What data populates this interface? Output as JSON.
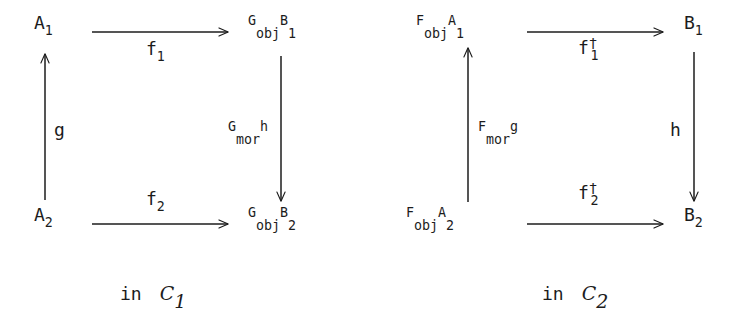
{
  "figure": {
    "type": "commutative-diagram-pair",
    "background_color": "#ffffff",
    "ink_color": "#1c1c1c",
    "diagrams": [
      {
        "id": "left",
        "caption_prefix": "in",
        "caption_category": "C",
        "caption_category_sub": "1",
        "nodes": {
          "top_left": {
            "base": "A",
            "sub": "1"
          },
          "top_right": {
            "functor": "G",
            "functor_sub": "obj",
            "base": "B",
            "sub": "1"
          },
          "bottom_left": {
            "base": "A",
            "sub": "2"
          },
          "bottom_right": {
            "functor": "G",
            "functor_sub": "obj",
            "base": "B",
            "sub": "2"
          }
        },
        "edges": {
          "top": {
            "base": "f",
            "sub": "1",
            "dagger": "",
            "direction": "right"
          },
          "bottom": {
            "base": "f",
            "sub": "2",
            "dagger": "",
            "direction": "right"
          },
          "left": {
            "base": "g",
            "sub": "",
            "functor": "",
            "functor_sub": "",
            "direction": "up"
          },
          "right": {
            "functor": "G",
            "functor_sub": "mor",
            "base": "h",
            "sub": "",
            "direction": "down"
          }
        }
      },
      {
        "id": "right",
        "caption_prefix": "in",
        "caption_category": "C",
        "caption_category_sub": "2",
        "nodes": {
          "top_left": {
            "functor": "F",
            "functor_sub": "obj",
            "base": "A",
            "sub": "1"
          },
          "top_right": {
            "base": "B",
            "sub": "1"
          },
          "bottom_left": {
            "functor": "F",
            "functor_sub": "obj",
            "base": "A",
            "sub": "2"
          },
          "bottom_right": {
            "base": "B",
            "sub": "2"
          }
        },
        "edges": {
          "top": {
            "base": "f",
            "sub": "1",
            "dagger": "†",
            "direction": "right"
          },
          "bottom": {
            "base": "f",
            "sub": "2",
            "dagger": "†",
            "direction": "right"
          },
          "left": {
            "functor": "F",
            "functor_sub": "mor",
            "base": "g",
            "sub": "",
            "direction": "up"
          },
          "right": {
            "base": "h",
            "sub": "",
            "functor": "",
            "functor_sub": "",
            "direction": "down"
          }
        }
      }
    ]
  },
  "left": {
    "node_A1_base": "A",
    "node_A1_sub": "1",
    "node_GobjB1_functor": "G",
    "node_GobjB1_functor_sub": "obj",
    "node_GobjB1_base": "B",
    "node_GobjB1_sub": "1",
    "node_A2_base": "A",
    "node_A2_sub": "2",
    "node_GobjB2_functor": "G",
    "node_GobjB2_functor_sub": "obj",
    "node_GobjB2_base": "B",
    "node_GobjB2_sub": "2",
    "edge_top_base": "f",
    "edge_top_sub": "1",
    "edge_bottom_base": "f",
    "edge_bottom_sub": "2",
    "edge_left_base": "g",
    "edge_right_functor": "G",
    "edge_right_functor_sub": "mor",
    "edge_right_base": "h",
    "caption_in": "in",
    "caption_cat": "C",
    "caption_cat_sub": "1"
  },
  "right": {
    "node_FobjA1_functor": "F",
    "node_FobjA1_functor_sub": "obj",
    "node_FobjA1_base": "A",
    "node_FobjA1_sub": "1",
    "node_B1_base": "B",
    "node_B1_sub": "1",
    "node_FobjA2_functor": "F",
    "node_FobjA2_functor_sub": "obj",
    "node_FobjA2_base": "A",
    "node_FobjA2_sub": "2",
    "node_B2_base": "B",
    "node_B2_sub": "2",
    "edge_top_base": "f",
    "edge_top_dagger": "†",
    "edge_top_sub": "1",
    "edge_bottom_base": "f",
    "edge_bottom_dagger": "†",
    "edge_bottom_sub": "2",
    "edge_left_functor": "F",
    "edge_left_functor_sub": "mor",
    "edge_left_base": "g",
    "edge_right_base": "h",
    "caption_in": "in",
    "caption_cat": "C",
    "caption_cat_sub": "2"
  }
}
